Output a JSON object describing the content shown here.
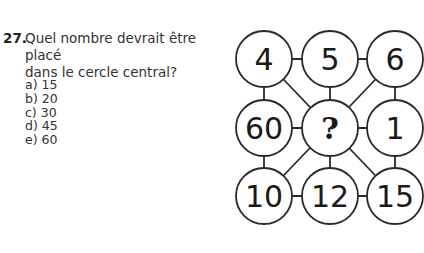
{
  "question": {
    "number": "27.",
    "text_line1": "Quel nombre devrait être placé",
    "text_line2": "dans le cercle central?",
    "options": [
      {
        "label": "a)",
        "value": "15"
      },
      {
        "label": "b)",
        "value": "20"
      },
      {
        "label": "c)",
        "value": "30"
      },
      {
        "label": "d)",
        "value": "45"
      },
      {
        "label": "e)",
        "value": "60"
      }
    ]
  },
  "puzzle": {
    "circles": [
      {
        "id": "top-left",
        "value": "4"
      },
      {
        "id": "top-middle",
        "value": "5"
      },
      {
        "id": "top-right",
        "value": "6"
      },
      {
        "id": "middle-left",
        "value": "60"
      },
      {
        "id": "center",
        "value": "?"
      },
      {
        "id": "middle-right",
        "value": "1"
      },
      {
        "id": "bottom-left",
        "value": "10"
      },
      {
        "id": "bottom-middle",
        "value": "12"
      },
      {
        "id": "bottom-right",
        "value": "15"
      }
    ]
  }
}
